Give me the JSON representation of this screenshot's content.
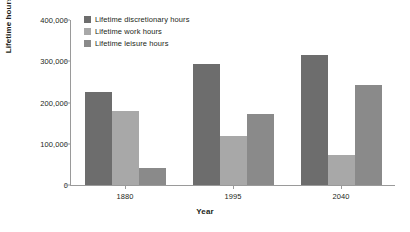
{
  "chart_data": {
    "type": "bar",
    "title": "",
    "xlabel": "Year",
    "ylabel": "Lifetime hours",
    "categories": [
      "1880",
      "1995",
      "2040"
    ],
    "ylim": [
      0,
      400000
    ],
    "ytick_labels": [
      "0",
      "100,000",
      "200,000",
      "300,000",
      "400,000"
    ],
    "ytick_values": [
      0,
      100000,
      200000,
      300000,
      400000
    ],
    "grid": false,
    "legend_position": "top-left",
    "series": [
      {
        "name": "Lifetime discretionary hours",
        "color": "#6d6d6d",
        "values": [
          225000,
          293000,
          316000
        ]
      },
      {
        "name": "Lifetime work hours",
        "color": "#a8a8a8",
        "values": [
          180000,
          120000,
          73000
        ]
      },
      {
        "name": "Lifetime leisure hours",
        "color": "#8a8a8a",
        "values": [
          42000,
          172000,
          243000
        ]
      }
    ]
  }
}
